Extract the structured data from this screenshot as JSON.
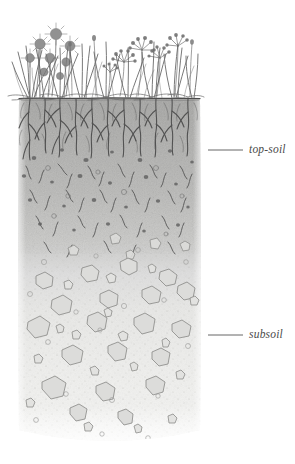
{
  "illustration": {
    "title": "Soil profile cross-section",
    "subject": "vegetated soil column showing top-soil and subsoil horizons",
    "style": "pencil / graphite botanical illustration, monochrome grayscale",
    "background_color": "#ffffff"
  },
  "labels": [
    {
      "id": "top-soil",
      "text": "top-soil",
      "style": "italic serif",
      "color": "#4a4a4a",
      "leader_line": {
        "x1": 208,
        "x2": 243,
        "y": 150
      },
      "text_position": {
        "x": 249,
        "y": 150
      }
    },
    {
      "id": "subsoil",
      "text": "subsoil",
      "style": "italic serif",
      "color": "#4a4a4a",
      "leader_line": {
        "x1": 208,
        "x2": 243,
        "y": 335
      },
      "text_position": {
        "x": 249,
        "y": 335
      }
    }
  ],
  "layers": [
    {
      "name": "vegetation",
      "description": "grasses and small flowering plants above the soil line",
      "top": 16,
      "bottom": 98,
      "color": "#6e6e6e"
    },
    {
      "name": "soil-surface-line",
      "description": "dark horizontal ground line",
      "y": 98,
      "color": "#4f4f4f"
    },
    {
      "name": "top-soil",
      "description": "dark gray horizon dense with roots, root fragments and organic specks",
      "top": 98,
      "bottom": 250,
      "color_top": "#a9a9a7",
      "color_bottom": "#d8d8d6"
    },
    {
      "name": "subsoil",
      "description": "pale stippled horizon containing angular rock fragments and pebbles",
      "top": 250,
      "bottom": 444,
      "color_top": "#e2e2e0",
      "color_bottom": "#f4f4f2"
    }
  ],
  "column": {
    "left": 18,
    "right": 201,
    "top": 98,
    "bottom": 444
  },
  "palette": {
    "ink": "#5a5a5a",
    "root_ink": "#4b4b4b",
    "rock_outline": "#8c8c8a",
    "rock_fill": "#dcdcda",
    "topsoil_gray": "#b5b5b3",
    "subsoil_gray": "#eeeeec",
    "label_gray": "#4a4a4a"
  }
}
